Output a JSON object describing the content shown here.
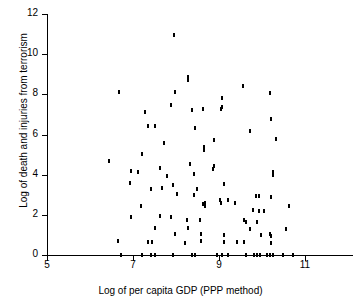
{
  "chart_data": {
    "type": "scatter",
    "title": "",
    "xlabel": "Log of per capita GDP (PPP method)",
    "ylabel": "Log of death and injuries from terrorism",
    "xlim": [
      5,
      11.8
    ],
    "ylim": [
      0,
      12
    ],
    "xticks": [
      5,
      7,
      9,
      11
    ],
    "yticks": [
      0,
      2,
      4,
      6,
      8,
      10,
      12
    ],
    "xticklabels": [
      "5",
      "7",
      "9",
      "11"
    ],
    "yticklabels": [
      "0",
      "2",
      "4",
      "6",
      "8",
      "10",
      "12"
    ],
    "grid": false,
    "legend": null,
    "marker": "small-vertical-tick",
    "marker_color": "#000000",
    "n_points": 168,
    "points": [
      [
        7.95,
        10.95
      ],
      [
        8.28,
        8.85
      ],
      [
        8.28,
        8.72
      ],
      [
        9.55,
        8.42
      ],
      [
        6.68,
        8.13
      ],
      [
        7.98,
        8.12
      ],
      [
        10.18,
        8.08
      ],
      [
        9.08,
        7.82
      ],
      [
        7.88,
        7.45
      ],
      [
        9.08,
        7.35
      ],
      [
        9.05,
        7.28
      ],
      [
        8.38,
        7.24
      ],
      [
        8.62,
        7.28
      ],
      [
        7.28,
        7.14
      ],
      [
        9.72,
        6.18
      ],
      [
        10.22,
        6.76
      ],
      [
        7.35,
        6.42
      ],
      [
        7.52,
        6.4
      ],
      [
        8.45,
        6.3
      ],
      [
        10.32,
        5.8
      ],
      [
        8.88,
        5.72
      ],
      [
        7.72,
        5.58
      ],
      [
        8.65,
        5.4
      ],
      [
        8.65,
        5.22
      ],
      [
        7.22,
        5.05
      ],
      [
        6.45,
        4.7
      ],
      [
        8.88,
        4.45
      ],
      [
        8.32,
        4.52
      ],
      [
        8.85,
        4.28
      ],
      [
        6.95,
        4.18
      ],
      [
        7.12,
        4.12
      ],
      [
        10.25,
        4.12
      ],
      [
        10.25,
        3.98
      ],
      [
        7.62,
        4.35
      ],
      [
        7.78,
        3.95
      ],
      [
        8.42,
        4.02
      ],
      [
        6.92,
        3.58
      ],
      [
        9.12,
        3.52
      ],
      [
        7.92,
        3.48
      ],
      [
        7.42,
        3.28
      ],
      [
        7.68,
        3.32
      ],
      [
        8.48,
        3.28
      ],
      [
        8.42,
        2.98
      ],
      [
        8.02,
        3.05
      ],
      [
        9.85,
        2.92
      ],
      [
        10.22,
        2.88
      ],
      [
        9.92,
        2.95
      ],
      [
        8.68,
        2.6
      ],
      [
        8.62,
        2.52
      ],
      [
        9.02,
        2.72
      ],
      [
        9.05,
        2.58
      ],
      [
        9.22,
        2.72
      ],
      [
        9.38,
        2.6
      ],
      [
        8.68,
        2.42
      ],
      [
        7.18,
        2.45
      ],
      [
        10.62,
        2.42
      ],
      [
        9.78,
        2.22
      ],
      [
        9.92,
        2.18
      ],
      [
        10.05,
        2.18
      ],
      [
        6.95,
        1.88
      ],
      [
        7.88,
        1.9
      ],
      [
        7.62,
        1.92
      ],
      [
        8.25,
        1.75
      ],
      [
        8.55,
        1.72
      ],
      [
        9.58,
        1.75
      ],
      [
        9.62,
        1.62
      ],
      [
        9.88,
        1.62
      ],
      [
        7.52,
        1.32
      ],
      [
        8.28,
        1.35
      ],
      [
        9.72,
        1.3
      ],
      [
        10.55,
        1.28
      ],
      [
        7.98,
        1.05
      ],
      [
        8.58,
        1.05
      ],
      [
        9.12,
        1.02
      ],
      [
        10.18,
        1.05
      ],
      [
        10.22,
        0.95
      ],
      [
        9.98,
        1.02
      ],
      [
        6.65,
        0.68
      ],
      [
        7.35,
        0.65
      ],
      [
        7.45,
        0.65
      ],
      [
        8.22,
        0.62
      ],
      [
        8.58,
        0.68
      ],
      [
        9.12,
        0.65
      ],
      [
        9.42,
        0.65
      ],
      [
        9.58,
        0.65
      ],
      [
        10.22,
        0.62
      ],
      [
        6.72,
        0.02
      ],
      [
        7.22,
        0.02
      ],
      [
        7.42,
        0.02
      ],
      [
        7.52,
        0.02
      ],
      [
        7.92,
        0.02
      ],
      [
        8.38,
        0.02
      ],
      [
        8.45,
        0.02
      ],
      [
        8.95,
        0.02
      ],
      [
        9.08,
        0.02
      ],
      [
        9.22,
        0.02
      ],
      [
        9.62,
        0.02
      ],
      [
        9.82,
        0.02
      ],
      [
        9.88,
        0.02
      ],
      [
        9.95,
        0.02
      ],
      [
        10.12,
        0.02
      ],
      [
        10.18,
        0.02
      ],
      [
        10.25,
        0.02
      ],
      [
        10.48,
        0.02
      ],
      [
        10.72,
        0.02
      ]
    ]
  },
  "axes": {
    "y_title": "Log of death and injuries from terrorism",
    "x_title": "Log of per capita GDP (PPP method)"
  }
}
